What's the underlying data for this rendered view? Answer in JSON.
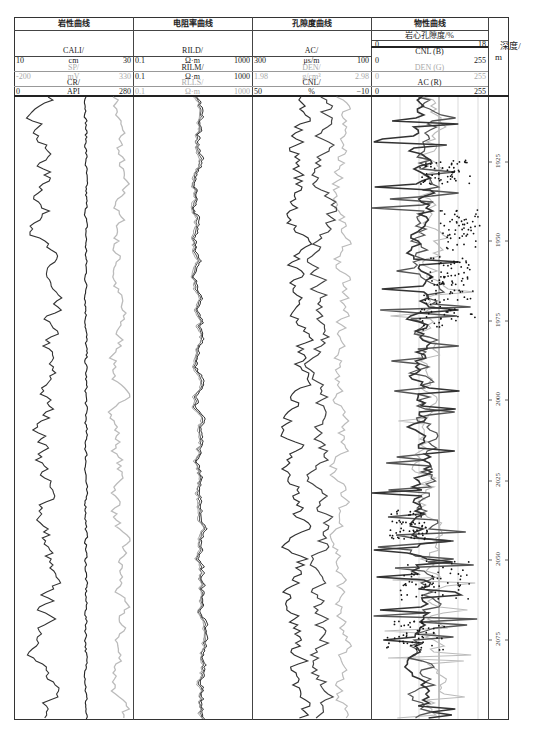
{
  "caption": "",
  "tracks": [
    {
      "title": "岩性曲线",
      "curves": [
        {
          "name": "CALI/",
          "unit": "cm",
          "min": "10",
          "max": "30",
          "color": "#333"
        },
        {
          "name": "SP/",
          "unit": "mV",
          "min": "-200",
          "max": "330",
          "color": "#aaa"
        },
        {
          "name": "CR/",
          "unit": "API",
          "min": "0",
          "max": "280",
          "color": "#333"
        }
      ]
    },
    {
      "title": "电阻率曲线",
      "curves": [
        {
          "name": "RILD/",
          "unit": "Ω·m",
          "min": "0.1",
          "max": "1000",
          "color": "#333"
        },
        {
          "name": "RILM/",
          "unit": "Ω·m",
          "min": "0.1",
          "max": "1000",
          "color": "#333"
        },
        {
          "name": "RLLS/",
          "unit": "Ω·m",
          "min": "0.1",
          "max": "1000",
          "color": "#aaa"
        }
      ]
    },
    {
      "title": "孔隙度曲线",
      "curves": [
        {
          "name": "AC/",
          "unit": "μs/m",
          "min": "300",
          "max": "100",
          "color": "#333"
        },
        {
          "name": "DEN/",
          "unit": "g/cm³",
          "min": "1.98",
          "max": "2.98",
          "color": "#aaa"
        },
        {
          "name": "CNL/",
          "unit": "%",
          "min": "50",
          "max": "−10",
          "color": "#333"
        }
      ]
    },
    {
      "title": "物性曲线",
      "subtitle": "岩心孔隙度/%",
      "sub_min": "0",
      "sub_max": "18",
      "curves": [
        {
          "name": "CNL (B)",
          "min": "0",
          "max": "255",
          "color": "#333"
        },
        {
          "name": "DEN (G)",
          "min": "0",
          "max": "255",
          "color": "#aaa"
        },
        {
          "name": "AC (R)",
          "min": "0",
          "max": "255",
          "color": "#333"
        }
      ]
    }
  ],
  "depth": {
    "label_line1": "深度/",
    "label_line2": "m",
    "ticks": [
      "1925",
      "1950",
      "1975",
      "2000",
      "2025",
      "2050",
      "2075"
    ]
  },
  "chart_data": {
    "type": "line",
    "ylabel": "深度/m",
    "ylim": [
      1905,
      2100
    ],
    "y_ticks": [
      1925,
      1950,
      1975,
      2000,
      2025,
      2050,
      2075
    ],
    "tracks": [
      {
        "name": "岩性曲线",
        "series": [
          "CALI (10–30 cm)",
          "SP (−200–330 mV)",
          "CR (0–280 API)"
        ]
      },
      {
        "name": "电阻率曲线",
        "series": [
          "RILD (0.1–1000 Ω·m)",
          "RILM (0.1–1000 Ω·m)",
          "RLLS (0.1–1000 Ω·m)"
        ]
      },
      {
        "name": "孔隙度曲线",
        "series": [
          "AC (300–100 μs/m)",
          "DEN (1.98–2.98 g/cm³)",
          "CNL (50–−10 %)"
        ]
      },
      {
        "name": "物性曲线",
        "series": [
          "岩心孔隙度 (0–18 %) scatter",
          "CNL (B) 0–255",
          "DEN (G) 0–255",
          "AC (R) 0–255"
        ]
      }
    ],
    "grid": "vertical gridlines in 物性曲线 track",
    "legend_position": "header"
  }
}
